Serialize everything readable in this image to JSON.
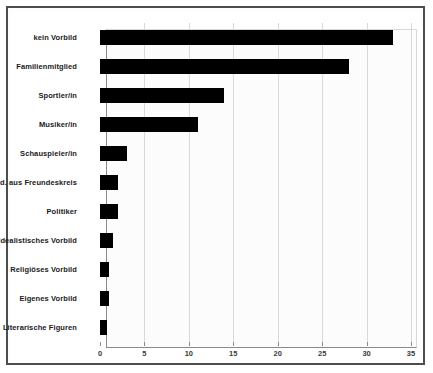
{
  "chart_data": {
    "type": "bar",
    "orientation": "horizontal",
    "title": "",
    "subtitle": "",
    "xlabel": "",
    "ylabel": "",
    "xlim": [
      0,
      35
    ],
    "xticks": [
      0,
      5,
      10,
      15,
      20,
      25,
      30,
      35
    ],
    "xtick_labels": [
      "0",
      "5",
      "10",
      "15",
      "20",
      "25",
      "30",
      "35"
    ],
    "grid": true,
    "grid_axis": "x",
    "legend": false,
    "legend_position": "none",
    "bar_color": "#000000",
    "background_color": "#fcfcfc",
    "categories": [
      "kein Vorbild",
      "Familienmitglied",
      "Sportler/in",
      "Musiker/in",
      "Schauspieler/in",
      "Jmd. aus Freundeskreis",
      "Politiker",
      "Idealistisches Vorbild",
      "Religiöses Vorbild",
      "Eigenes Vorbild",
      "Literarische Figuren"
    ],
    "values": [
      33,
      28,
      14,
      11,
      3,
      2,
      2,
      1.5,
      1,
      1,
      0.8
    ]
  }
}
